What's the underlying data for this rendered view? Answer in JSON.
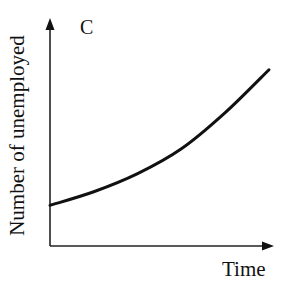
{
  "chart_data": {
    "type": "line",
    "title": "C",
    "xlabel": "Time",
    "ylabel": "Number of unemployed",
    "grid": false,
    "legend": null,
    "axis_ticks": false,
    "series": [
      {
        "name": "Number of unemployed",
        "description": "Increasing at an increasing rate (convex, exponential-like growth)",
        "x": [
          0,
          0.2,
          0.4,
          0.6,
          0.8,
          1.0
        ],
        "y": [
          0.18,
          0.24,
          0.32,
          0.43,
          0.59,
          0.78
        ]
      }
    ],
    "xlim": [
      0,
      1
    ],
    "ylim": [
      0,
      1
    ]
  },
  "labels": {
    "panel": "C",
    "x_axis": "Time",
    "y_axis": "Number of unemployed"
  },
  "colors": {
    "line": "#111111",
    "axis": "#222222",
    "background": "#ffffff"
  }
}
